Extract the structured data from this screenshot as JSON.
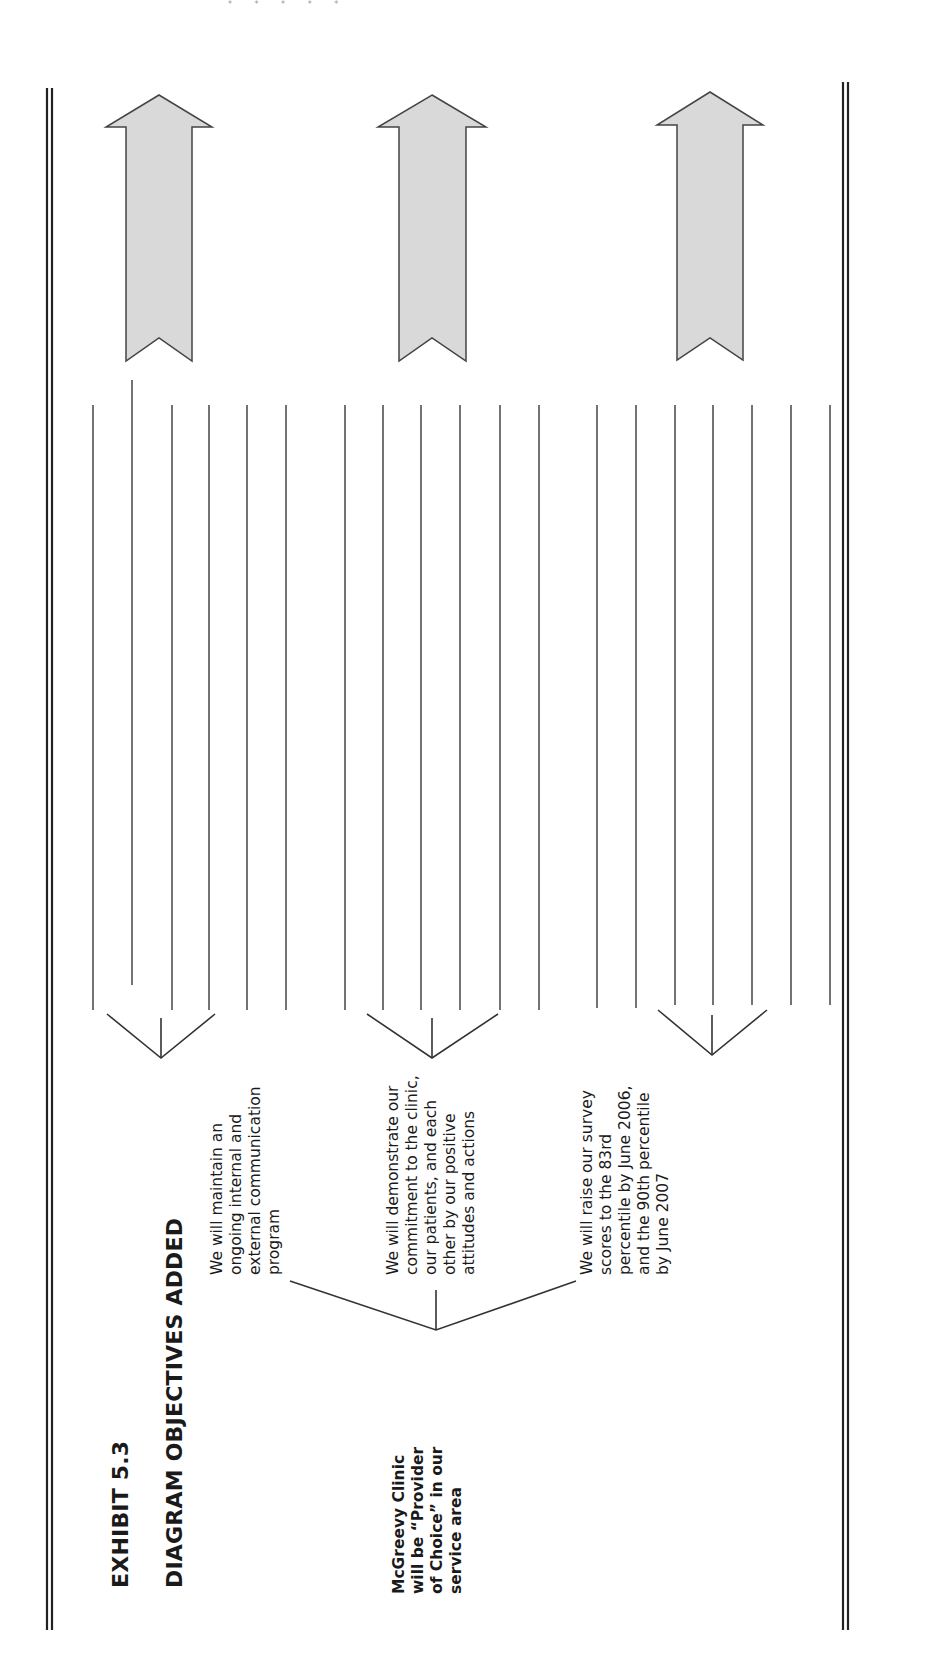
{
  "exhibit": {
    "number": "EXHIBIT 5.3",
    "title": "DIAGRAM OBJECTIVES ADDED"
  },
  "root_node": {
    "text": "McGreevy Clinic\nwill be “Provider\nof Choice” in our\nservice area"
  },
  "objectives": [
    {
      "text": "We will maintain an\nongoing internal and\nexternal communication\nprogram"
    },
    {
      "text": "We will demonstrate our\ncommitment to the clinic,\nour patients, and each\nother by our positive\nattitudes and actions"
    },
    {
      "text": "We will raise our survey\nscores to the 83rd\npercentile by June 2006,\nand the 90th percentile\nby June 2007"
    }
  ],
  "decoration": {
    "stars": "* * * * *"
  },
  "colors": {
    "arrow_fill": "#d9d9d9",
    "line": "#333333"
  }
}
